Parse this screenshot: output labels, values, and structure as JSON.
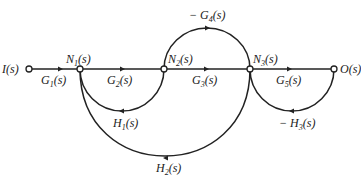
{
  "diagram": {
    "type": "signal-flow-graph",
    "nodes": [
      {
        "id": "I",
        "label": "I(s)",
        "x": 29,
        "y": 69
      },
      {
        "id": "N1",
        "label": "N",
        "sub": "1",
        "tail": "(s)",
        "x": 80,
        "y": 69
      },
      {
        "id": "N2",
        "label": "N",
        "sub": "2",
        "tail": "(s)",
        "x": 164,
        "y": 69
      },
      {
        "id": "N3",
        "label": "N",
        "sub": "3",
        "tail": "(s)",
        "x": 250,
        "y": 69
      },
      {
        "id": "O",
        "label": "O(s)",
        "x": 334,
        "y": 69
      }
    ],
    "edges": [
      {
        "from": "I",
        "to": "N1",
        "gain": "G",
        "sub": "1",
        "tail": "(s)",
        "prefix": ""
      },
      {
        "from": "N1",
        "to": "N2",
        "gain": "G",
        "sub": "2",
        "tail": "(s)",
        "prefix": ""
      },
      {
        "from": "N2",
        "to": "N3",
        "gain": "G",
        "sub": "3",
        "tail": "(s)",
        "prefix": ""
      },
      {
        "from": "N3",
        "to": "O",
        "gain": "G",
        "sub": "5",
        "tail": "(s)",
        "prefix": ""
      },
      {
        "from": "N2",
        "to": "N3",
        "gain": "G",
        "sub": "4",
        "tail": "(s)",
        "prefix": "− ",
        "path": "upper-arc"
      },
      {
        "from": "N2",
        "to": "N1",
        "gain": "H",
        "sub": "1",
        "tail": "(s)",
        "prefix": "",
        "path": "lower-arc"
      },
      {
        "from": "N3",
        "to": "N1",
        "gain": "H",
        "sub": "2",
        "tail": "(s)",
        "prefix": "",
        "path": "lower-arc"
      },
      {
        "from": "O",
        "to": "N3",
        "gain": "H",
        "sub": "3",
        "tail": "(s)",
        "prefix": "− ",
        "path": "lower-arc"
      }
    ]
  },
  "labels": {
    "I": "I(s)",
    "O": "O(s)",
    "N1_main": "N",
    "N1_sub": "1",
    "N1_tail": "(s)",
    "N2_main": "N",
    "N2_sub": "2",
    "N2_tail": "(s)",
    "N3_main": "N",
    "N3_sub": "3",
    "N3_tail": "(s)",
    "G1_main": "G",
    "G1_sub": "1",
    "G1_tail": "(s)",
    "G2_main": "G",
    "G2_sub": "2",
    "G2_tail": "(s)",
    "G3_main": "G",
    "G3_sub": "3",
    "G3_tail": "(s)",
    "G4_prefix": "− ",
    "G4_main": "G",
    "G4_sub": "4",
    "G4_tail": "(s)",
    "G5_main": "G",
    "G5_sub": "5",
    "G5_tail": "(s)",
    "H1_main": "H",
    "H1_sub": "1",
    "H1_tail": "(s)",
    "H2_main": "H",
    "H2_sub": "2",
    "H2_tail": "(s)",
    "H3_prefix": "− ",
    "H3_main": "H",
    "H3_sub": "3",
    "H3_tail": "(s)"
  }
}
